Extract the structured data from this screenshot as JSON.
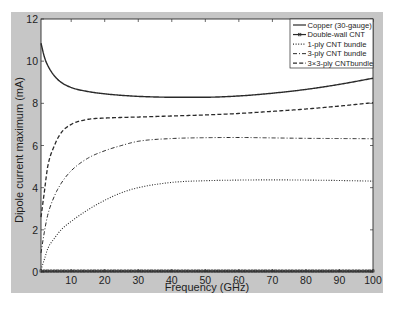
{
  "figure": {
    "background": "#c6c6c6",
    "axes_background": "#ffffff",
    "ink": "#2a2a2a",
    "page_background": "#ffffff"
  },
  "chart_data": {
    "type": "line",
    "title": "",
    "xlabel": "Frequency (GHz)",
    "ylabel": "Dipole current maximum (mA)",
    "xlim": [
      1,
      100
    ],
    "ylim": [
      0,
      12
    ],
    "xticks": [
      10,
      20,
      30,
      40,
      50,
      60,
      70,
      80,
      90,
      100
    ],
    "yticks": [
      0,
      2,
      4,
      6,
      8,
      10,
      12
    ],
    "grid": false,
    "legend_position": "upper right",
    "x": [
      1,
      2,
      3,
      5,
      7,
      10,
      15,
      20,
      25,
      30,
      40,
      50,
      60,
      70,
      80,
      90,
      100
    ],
    "series": [
      {
        "name": "Copper (30-gauge)",
        "style": "solid",
        "marker": "none",
        "values": [
          10.85,
          10.2,
          9.8,
          9.3,
          9.0,
          8.75,
          8.56,
          8.45,
          8.38,
          8.33,
          8.29,
          8.29,
          8.35,
          8.48,
          8.66,
          8.9,
          9.19
        ]
      },
      {
        "name": "Double-wall CNT",
        "style": "solid",
        "marker": "square",
        "values": [
          0.05,
          0.05,
          0.05,
          0.05,
          0.05,
          0.05,
          0.05,
          0.05,
          0.05,
          0.05,
          0.05,
          0.05,
          0.05,
          0.05,
          0.05,
          0.05,
          0.05
        ]
      },
      {
        "name": "1-ply CNT  bundle",
        "style": "dotted",
        "marker": "none",
        "values": [
          0.1,
          0.6,
          1.1,
          1.6,
          2.0,
          2.4,
          2.95,
          3.4,
          3.76,
          4.0,
          4.25,
          4.33,
          4.36,
          4.37,
          4.36,
          4.34,
          4.31
        ]
      },
      {
        "name": "3-ply CNT  bundle",
        "style": "dashdot",
        "marker": "none",
        "values": [
          0.9,
          1.9,
          2.7,
          3.6,
          4.2,
          4.8,
          5.4,
          5.75,
          6.0,
          6.2,
          6.33,
          6.37,
          6.38,
          6.36,
          6.34,
          6.33,
          6.32
        ]
      },
      {
        "name": "3×3-ply CNTbundle",
        "style": "dashed",
        "marker": "none",
        "values": [
          2.6,
          3.8,
          5.0,
          6.0,
          6.6,
          7.0,
          7.24,
          7.3,
          7.33,
          7.35,
          7.4,
          7.45,
          7.52,
          7.62,
          7.73,
          7.87,
          8.03
        ]
      }
    ]
  }
}
